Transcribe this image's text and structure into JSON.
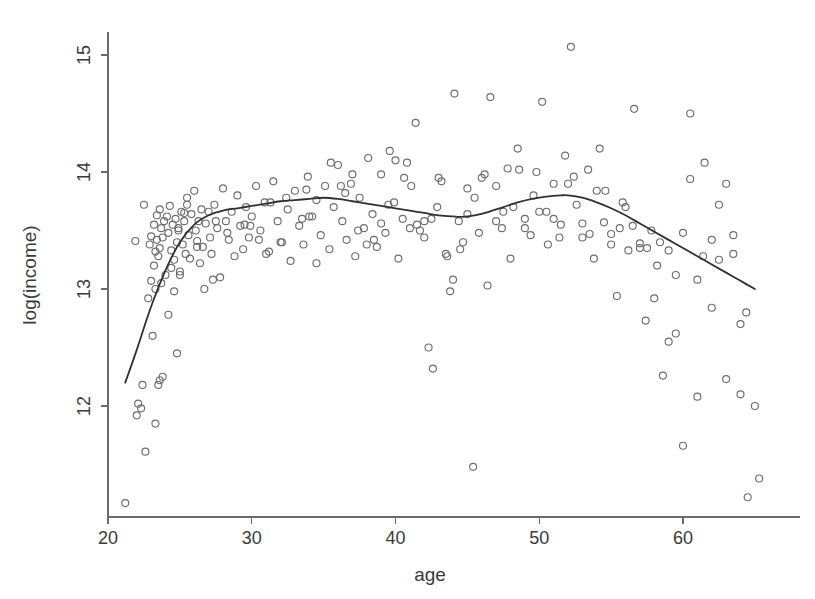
{
  "figure": {
    "background_color": "#ffffff",
    "point_color": "#6e6e6e",
    "curve_color": "#303030",
    "axis_color": "#6b6b6b"
  },
  "chart_data": {
    "type": "scatter",
    "title": "",
    "xlabel": "age",
    "ylabel": "log(income)",
    "xlim": [
      20,
      66
    ],
    "ylim": [
      11.05,
      15.25
    ],
    "xticks": [
      20,
      30,
      40,
      50,
      60
    ],
    "xticklabels": [
      "20",
      "30",
      "40",
      "50",
      "60"
    ],
    "yticks": [
      12,
      13,
      14,
      15
    ],
    "yticklabels": [
      "12",
      "13",
      "14",
      "15"
    ],
    "grid": false,
    "legend": null,
    "marker": "open-circle",
    "marker_size_px": 7,
    "x": [
      21.2,
      22.1,
      22.3,
      22.4,
      22.6,
      22.8,
      22.9,
      23.0,
      23.0,
      23.1,
      23.2,
      23.2,
      23.3,
      23.3,
      23.4,
      23.4,
      23.5,
      23.5,
      23.6,
      23.6,
      23.7,
      23.8,
      23.8,
      23.9,
      24.0,
      24.1,
      24.2,
      24.2,
      24.3,
      24.4,
      24.5,
      24.6,
      24.6,
      24.7,
      24.8,
      24.8,
      24.9,
      25.0,
      25.1,
      25.2,
      25.3,
      25.4,
      25.5,
      25.6,
      25.7,
      25.8,
      26.0,
      26.1,
      26.2,
      26.3,
      26.4,
      26.5,
      26.6,
      26.8,
      27.0,
      27.1,
      27.2,
      27.4,
      27.6,
      27.8,
      28.0,
      28.2,
      28.4,
      28.6,
      28.8,
      29.0,
      29.2,
      29.4,
      29.6,
      29.8,
      30.0,
      30.3,
      30.6,
      30.9,
      31.2,
      31.5,
      31.8,
      32.1,
      32.4,
      32.7,
      33.0,
      33.3,
      33.6,
      33.9,
      34.2,
      34.5,
      34.8,
      35.1,
      35.4,
      35.7,
      36.0,
      36.3,
      36.6,
      36.9,
      37.2,
      37.5,
      37.8,
      38.1,
      38.4,
      38.7,
      39.0,
      39.3,
      39.6,
      39.9,
      40.2,
      40.5,
      40.8,
      41.1,
      41.4,
      41.7,
      42.0,
      42.3,
      42.6,
      42.9,
      43.2,
      43.5,
      43.8,
      44.1,
      44.4,
      44.7,
      45.0,
      45.4,
      45.8,
      46.2,
      46.6,
      47.0,
      47.4,
      47.8,
      48.2,
      48.6,
      49.0,
      49.4,
      49.8,
      50.2,
      50.6,
      51.0,
      51.4,
      51.8,
      52.2,
      52.6,
      53.0,
      53.4,
      53.8,
      54.2,
      54.6,
      55.0,
      55.4,
      55.8,
      56.2,
      56.6,
      57.0,
      57.4,
      57.8,
      58.2,
      58.6,
      59.0,
      59.5,
      60.0,
      60.5,
      61.0,
      61.5,
      62.0,
      62.5,
      63.0,
      63.5,
      64.0,
      64.5,
      65.0,
      65.3,
      22.5,
      23.7,
      24.4,
      25.5,
      26.7,
      28.3,
      29.5,
      31.0,
      33.5,
      35.5,
      37.0,
      38.5,
      40.0,
      41.5,
      43.0,
      44.5,
      46.0,
      47.5,
      49.0,
      50.5,
      52.0,
      53.5,
      55.0,
      56.5,
      58.0,
      59.5,
      61.0,
      62.5,
      64.0,
      23.3,
      25.0,
      27.5,
      30.5,
      32.5,
      34.5,
      36.5,
      38.0,
      39.5,
      41.0,
      42.5,
      44.0,
      45.5,
      47.0,
      48.5,
      50.0,
      51.5,
      53.0,
      54.5,
      56.0,
      57.5,
      59.0,
      60.5,
      62.0,
      63.5,
      22.0,
      24.9,
      26.2,
      29.9,
      32.0,
      34.0,
      36.2,
      39.0,
      42.0,
      45.0,
      48.0,
      51.0,
      54.0,
      57.0,
      60.0,
      63.0,
      21.9,
      23.6,
      25.3,
      27.3,
      31.3,
      33.8,
      37.4,
      40.6,
      43.6,
      46.4,
      49.6,
      52.4,
      55.6,
      58.4,
      61.4,
      64.4
    ],
    "y": [
      11.17,
      12.02,
      11.98,
      12.18,
      11.61,
      12.92,
      13.38,
      13.45,
      13.07,
      12.6,
      13.55,
      13.2,
      13.32,
      11.85,
      13.63,
      13.42,
      13.28,
      12.18,
      13.68,
      13.35,
      13.52,
      12.25,
      13.44,
      13.58,
      13.12,
      13.62,
      13.48,
      12.78,
      13.71,
      13.33,
      13.55,
      13.25,
      12.98,
      13.6,
      13.4,
      12.45,
      13.52,
      13.12,
      13.66,
      13.38,
      13.58,
      13.3,
      13.72,
      13.46,
      13.26,
      13.64,
      13.84,
      13.5,
      13.41,
      13.58,
      13.22,
      13.68,
      13.36,
      13.56,
      13.66,
      13.44,
      13.3,
      13.72,
      13.52,
      13.1,
      13.86,
      13.58,
      13.42,
      13.66,
      13.28,
      13.8,
      13.54,
      13.34,
      13.7,
      13.44,
      13.62,
      13.88,
      13.5,
      13.74,
      13.32,
      13.92,
      13.58,
      13.4,
      13.78,
      13.24,
      13.84,
      13.54,
      13.38,
      13.96,
      13.62,
      13.76,
      13.46,
      13.88,
      13.34,
      13.7,
      14.06,
      13.58,
      13.42,
      13.9,
      13.28,
      13.78,
      13.52,
      14.12,
      13.64,
      13.36,
      13.98,
      13.48,
      14.18,
      13.74,
      13.26,
      13.6,
      14.08,
      13.88,
      14.42,
      13.5,
      13.44,
      12.5,
      12.32,
      13.7,
      13.92,
      13.3,
      12.98,
      14.67,
      13.58,
      13.4,
      13.64,
      11.48,
      13.48,
      13.98,
      14.64,
      13.88,
      13.52,
      14.03,
      13.7,
      14.02,
      13.6,
      13.46,
      14.0,
      14.6,
      13.38,
      13.9,
      13.44,
      14.14,
      15.07,
      13.72,
      13.56,
      14.02,
      13.26,
      14.2,
      13.84,
      13.47,
      12.94,
      13.74,
      13.33,
      14.54,
      13.39,
      12.73,
      13.5,
      13.2,
      12.26,
      13.33,
      12.62,
      11.66,
      14.5,
      13.08,
      14.08,
      12.84,
      13.72,
      12.23,
      13.3,
      12.1,
      11.22,
      12.0,
      11.38,
      13.72,
      13.05,
      13.18,
      13.78,
      13.0,
      13.48,
      13.55,
      13.3,
      13.6,
      14.08,
      13.98,
      13.42,
      14.1,
      13.55,
      13.95,
      13.34,
      13.95,
      13.66,
      13.52,
      13.66,
      13.9,
      13.47,
      13.38,
      13.54,
      12.92,
      13.12,
      12.08,
      13.25,
      12.7,
      13.0,
      13.15,
      13.58,
      13.42,
      13.68,
      13.22,
      13.82,
      13.38,
      13.72,
      13.52,
      13.6,
      13.08,
      13.78,
      13.58,
      14.2,
      13.66,
      13.55,
      13.44,
      13.57,
      13.7,
      13.35,
      12.55,
      13.94,
      13.42,
      13.46,
      11.92,
      13.5,
      13.36,
      13.54,
      13.4,
      13.62,
      13.88,
      13.56,
      13.58,
      13.86,
      13.26,
      13.6,
      13.84,
      13.35,
      13.48,
      13.9,
      13.41,
      12.22,
      13.65,
      13.08,
      13.74,
      13.85,
      13.5,
      13.95,
      13.28,
      13.03,
      13.8,
      13.96,
      13.52,
      13.4,
      13.28,
      12.8,
      13.1
    ],
    "fit_curve": {
      "label": "smoothing-spline",
      "x": [
        21.2,
        22.0,
        23.0,
        24.0,
        25.0,
        26.0,
        27.0,
        28.0,
        29.0,
        30.0,
        31.0,
        32.0,
        33.0,
        34.0,
        35.0,
        36.0,
        37.0,
        38.0,
        39.0,
        40.0,
        41.0,
        42.0,
        43.0,
        44.0,
        44.6,
        45.5,
        46.5,
        47.5,
        48.5,
        49.5,
        50.5,
        51.5,
        52.0,
        53.0,
        54.0,
        55.0,
        56.0,
        57.0,
        58.0,
        59.0,
        60.0,
        61.0,
        62.0,
        63.0,
        64.0,
        65.0
      ],
      "y": [
        12.2,
        12.48,
        12.85,
        13.16,
        13.4,
        13.55,
        13.63,
        13.67,
        13.69,
        13.71,
        13.73,
        13.75,
        13.76,
        13.77,
        13.78,
        13.77,
        13.75,
        13.73,
        13.71,
        13.69,
        13.67,
        13.65,
        13.63,
        13.62,
        13.617,
        13.63,
        13.66,
        13.7,
        13.74,
        13.77,
        13.79,
        13.8,
        13.8,
        13.78,
        13.74,
        13.69,
        13.63,
        13.56,
        13.49,
        13.42,
        13.35,
        13.28,
        13.21,
        13.14,
        13.07,
        13.0
      ]
    }
  }
}
